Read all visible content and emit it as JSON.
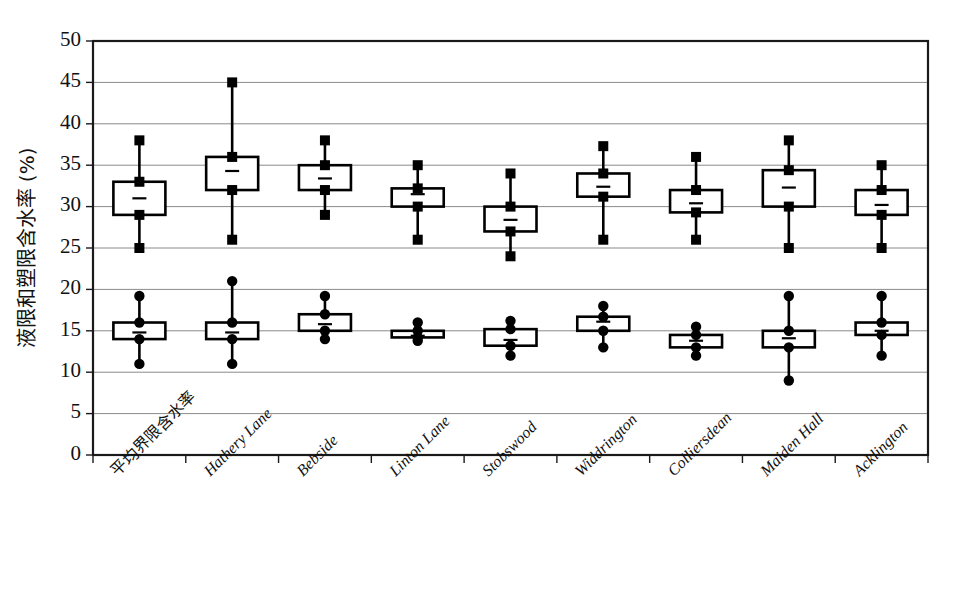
{
  "chart_data": {
    "type": "box",
    "title": "",
    "xlabel": "",
    "ylabel": "液限和塑限含水率 (%)",
    "ylim": [
      0,
      50
    ],
    "ytick_step": 5,
    "yticks": [
      "0",
      "5",
      "10",
      "15",
      "20",
      "25",
      "30",
      "35",
      "40",
      "45",
      "50"
    ],
    "grid": "horizontal",
    "legend": "none",
    "categories": [
      "平均界限含水率",
      "Hathery Lane",
      "Bebside",
      "Linton Lane",
      "Stobswood",
      "Widdrington",
      "Colliersdean",
      "Maiden Hall",
      "Acklington"
    ],
    "series": [
      {
        "name": "液限 (liquid limit, upper series)",
        "marker": "square",
        "boxes": [
          {
            "category": "平均界限含水率",
            "min": 25.0,
            "q1": 29.0,
            "median": 31.0,
            "q3": 33.0,
            "max": 38.0
          },
          {
            "category": "Hathery Lane",
            "min": 26.0,
            "q1": 32.0,
            "median": 34.3,
            "q3": 36.0,
            "max": 45.0
          },
          {
            "category": "Bebside",
            "min": 29.0,
            "q1": 32.0,
            "median": 33.4,
            "q3": 35.0,
            "max": 38.0
          },
          {
            "category": "Linton Lane",
            "min": 26.0,
            "q1": 30.0,
            "median": 31.5,
            "q3": 32.2,
            "max": 35.0
          },
          {
            "category": "Stobswood",
            "min": 24.0,
            "q1": 27.0,
            "median": 28.4,
            "q3": 30.0,
            "max": 34.0
          },
          {
            "category": "Widdrington",
            "min": 26.0,
            "q1": 31.2,
            "median": 32.4,
            "q3": 34.0,
            "max": 37.3
          },
          {
            "category": "Colliersdean",
            "min": 26.0,
            "q1": 29.3,
            "median": 30.4,
            "q3": 32.0,
            "max": 36.0
          },
          {
            "category": "Maiden Hall",
            "min": 25.0,
            "q1": 30.0,
            "median": 32.3,
            "q3": 34.4,
            "max": 38.0
          },
          {
            "category": "Acklington",
            "min": 25.0,
            "q1": 29.0,
            "median": 30.2,
            "q3": 32.0,
            "max": 35.0
          }
        ]
      },
      {
        "name": "塑限 (plastic limit, lower series)",
        "marker": "circle",
        "boxes": [
          {
            "category": "平均界限含水率",
            "min": 11.0,
            "q1": 14.0,
            "median": 14.8,
            "q3": 16.0,
            "max": 19.2
          },
          {
            "category": "Hathery Lane",
            "min": 11.0,
            "q1": 14.0,
            "median": 14.8,
            "q3": 16.0,
            "max": 21.0
          },
          {
            "category": "Bebside",
            "min": 14.0,
            "q1": 15.0,
            "median": 15.8,
            "q3": 17.0,
            "max": 19.2
          },
          {
            "category": "Linton Lane",
            "min": 13.8,
            "q1": 14.2,
            "median": 14.4,
            "q3": 15.0,
            "max": 16.0
          },
          {
            "category": "Stobswood",
            "min": 12.0,
            "q1": 13.2,
            "median": 13.9,
            "q3": 15.2,
            "max": 16.2
          },
          {
            "category": "Widdrington",
            "min": 13.0,
            "q1": 15.0,
            "median": 16.1,
            "q3": 16.7,
            "max": 18.0
          },
          {
            "category": "Colliersdean",
            "min": 12.0,
            "q1": 13.0,
            "median": 13.8,
            "q3": 14.5,
            "max": 15.5
          },
          {
            "category": "Maiden Hall",
            "min": 9.0,
            "q1": 13.0,
            "median": 14.1,
            "q3": 15.0,
            "max": 19.2
          },
          {
            "category": "Acklington",
            "min": 12.0,
            "q1": 14.5,
            "median": 15.0,
            "q3": 16.0,
            "max": 19.2
          }
        ]
      }
    ]
  },
  "geometry": {
    "plot_left": 93,
    "plot_right": 928,
    "plot_top": 41,
    "plot_bottom": 455,
    "box_half_width": 26
  },
  "style": {
    "axis_color": "#1a1a1a",
    "grid_color": "#8a8a8a",
    "marker_color": "#000000",
    "box_fill": "#ffffff",
    "background": "#ffffff"
  }
}
